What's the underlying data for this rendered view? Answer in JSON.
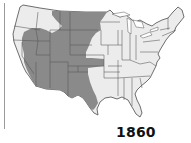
{
  "map": {
    "title": "1860",
    "subject": "United States frontier / unsettled territory",
    "legend_colors": {
      "settled": "#ececec",
      "unsettled": "#8a8a8a",
      "border": "#555555"
    }
  }
}
